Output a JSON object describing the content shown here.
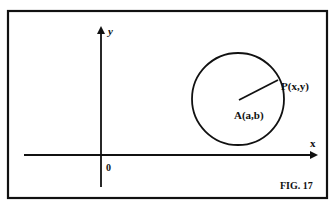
{
  "figure": {
    "caption": "FIG. 17",
    "axes": {
      "x_label": "x",
      "y_label": "y",
      "origin_label": "0"
    },
    "circle": {
      "center_label": "A(a,b)",
      "point_label": "P(x,y)"
    }
  }
}
